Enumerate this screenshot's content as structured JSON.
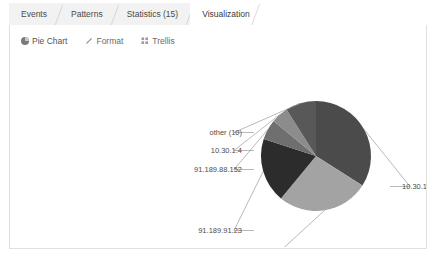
{
  "tabs": [
    {
      "label": "Events",
      "active": false
    },
    {
      "label": "Patterns",
      "active": false
    },
    {
      "label": "Statistics (15)",
      "active": false
    },
    {
      "label": "Visualization",
      "active": true
    }
  ],
  "toolbar": {
    "pie_chart_label": "Pie Chart",
    "format_label": "Format",
    "trellis_label": "Trellis",
    "pie_icon": "pie-chart-icon",
    "format_icon": "pencil-icon",
    "trellis_icon": "grid-icon"
  },
  "chart_data": {
    "type": "pie",
    "title": "",
    "legend": "labels",
    "labels": [
      "10.30.1.3",
      "10.20.1.2",
      "91.189.91.23",
      "91.189.88.152",
      "10.30.1.4",
      "other (10)"
    ],
    "values": [
      34,
      27,
      19,
      6,
      5,
      9
    ],
    "colors": [
      "#4b4b4b",
      "#a3a3a3",
      "#2c2c2c",
      "#6f6f6f",
      "#8c8c8c",
      "#585858"
    ],
    "label_positions": [
      {
        "text": "10.30.1.3",
        "x": 392,
        "y": 134,
        "anchor": "start"
      },
      {
        "text": "10.20.1.2",
        "x": 232,
        "y": 241,
        "anchor": "end"
      },
      {
        "text": "91.189.91.23",
        "x": 232,
        "y": 178,
        "anchor": "end"
      },
      {
        "text": "91.189.88.152",
        "x": 232,
        "y": 117,
        "anchor": "end"
      },
      {
        "text": "10.30.1.4",
        "x": 232,
        "y": 98,
        "anchor": "end"
      },
      {
        "text": "other (10)",
        "x": 232,
        "y": 80,
        "anchor": "end"
      }
    ]
  }
}
